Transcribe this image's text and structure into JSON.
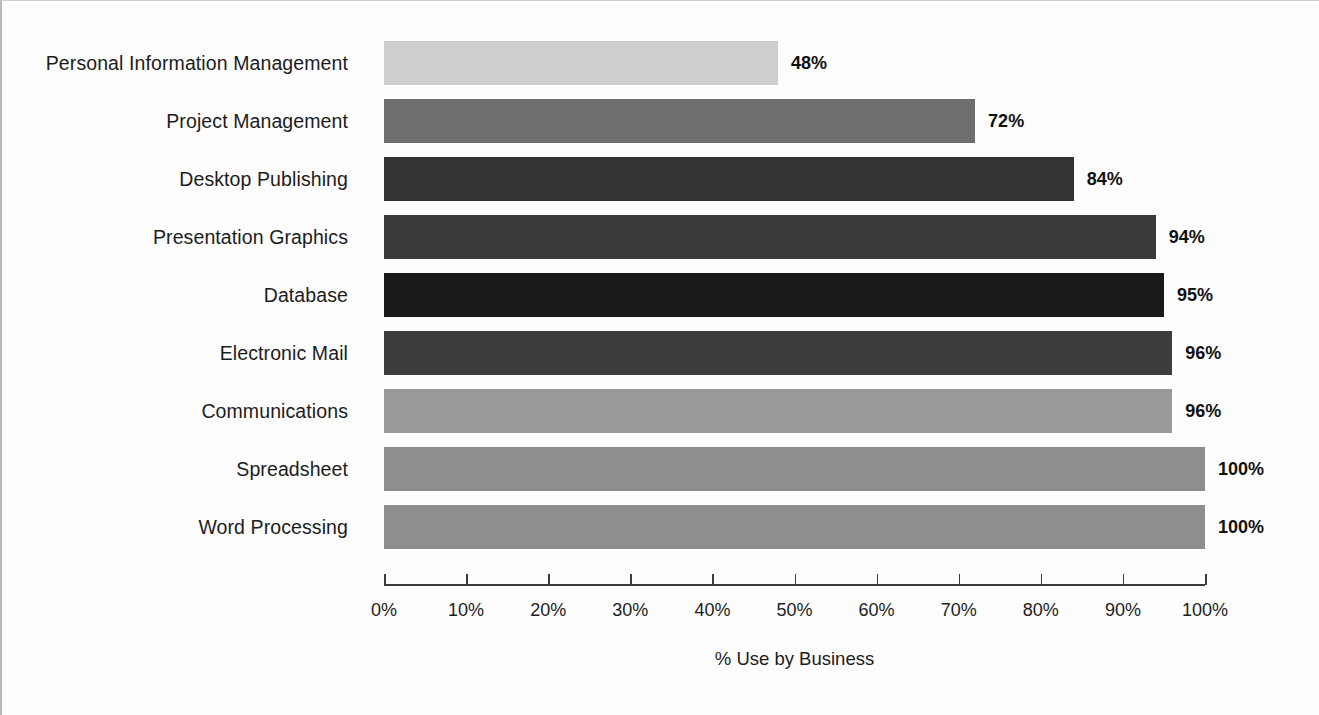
{
  "chart_data": {
    "type": "bar",
    "orientation": "horizontal",
    "title": "",
    "xlabel": "% Use by Business",
    "ylabel": "",
    "xlim": [
      0,
      100
    ],
    "grid": false,
    "legend": false,
    "categories": [
      "Personal Information Management",
      "Project Management",
      "Desktop Publishing",
      "Presentation Graphics",
      "Database",
      "Electronic Mail",
      "Communications",
      "Spreadsheet",
      "Word Processing"
    ],
    "values": [
      48,
      72,
      84,
      94,
      95,
      96,
      96,
      100,
      100
    ],
    "value_labels": [
      "48%",
      "72%",
      "84%",
      "94%",
      "95%",
      "96%",
      "96%",
      "100%",
      "100%"
    ],
    "bar_colors": [
      "#cecece",
      "#6e6e6e",
      "#333333",
      "#3a3a3a",
      "#1a1a1a",
      "#3d3d3d",
      "#9a9a9a",
      "#8e8e8e",
      "#8e8e8e"
    ],
    "xticks": [
      0,
      10,
      20,
      30,
      40,
      50,
      60,
      70,
      80,
      90,
      100
    ],
    "xtick_labels": [
      "0%",
      "10%",
      "20%",
      "30%",
      "40%",
      "50%",
      "60%",
      "70%",
      "80%",
      "90%",
      "100%"
    ]
  },
  "axis": {
    "title": "% Use by Business"
  }
}
